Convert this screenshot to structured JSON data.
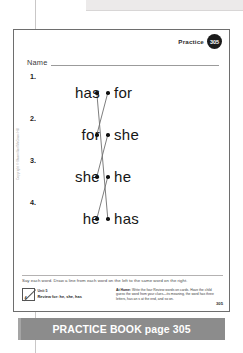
{
  "sheet": {
    "practice_label": "Practice",
    "practice_number": "305",
    "name_label": "Name",
    "instruction": "Say each word. Draw a line from each word on the left to the same word on the right.",
    "page_number": "305",
    "copyright": "Copyright © Macmillan/McGraw-Hill"
  },
  "exercise": {
    "rows": [
      {
        "number": "1.",
        "left_word": "has",
        "right_word": "for"
      },
      {
        "number": "2.",
        "left_word": "for",
        "right_word": "she"
      },
      {
        "number": "3.",
        "left_word": "she",
        "right_word": "he"
      },
      {
        "number": "4.",
        "left_word": "he",
        "right_word": "has"
      }
    ],
    "connections": [
      {
        "from_row": 1,
        "to_row": 4,
        "word": "has"
      },
      {
        "from_row": 2,
        "to_row": 1,
        "word": "for"
      },
      {
        "from_row": 3,
        "to_row": 2,
        "word": "she"
      },
      {
        "from_row": 4,
        "to_row": 3,
        "word": "he"
      }
    ]
  },
  "footer": {
    "unit_glyph_number": "4",
    "unit_line1": "Unit 5",
    "unit_line2": "Review for: he, she, has",
    "at_home_label": "At Home:",
    "at_home_text": " Write the four Review words on cards. Have the child guess the word from your clues—its meaning, the word has three letters, has an s at the end, and so on."
  },
  "banner": {
    "text": "PRACTICE BOOK page 305"
  },
  "colors": {
    "banner_bg": "#8c8c8c",
    "badge_bg": "#1b1b1b",
    "sheet_border": "#6e6e6e",
    "line_stroke": "#6f6f6f"
  }
}
